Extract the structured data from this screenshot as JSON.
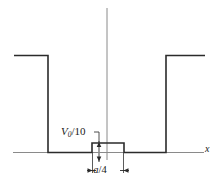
{
  "figure": {
    "axis_label_x": "x",
    "bump_height_label": {
      "symbol": "V",
      "subscript": "0",
      "divisor": "/10",
      "full": "V0/10"
    },
    "bump_width_label": {
      "symbol": "a",
      "divisor": "/4",
      "full": "a/4"
    },
    "colors": {
      "curve": "#2b2b2b",
      "axis": "#6f6f6f",
      "background": "#ffffff",
      "text": "#1a1a1a"
    },
    "geometry": {
      "baseline_y": 152,
      "well_top_y": 55,
      "left_wall_x": 48,
      "right_wall_x": 166,
      "bump_left_x": 92,
      "bump_right_x": 124,
      "bump_top_y": 143,
      "vertical_axis_x": 107,
      "dimension_line_y": 170
    }
  }
}
